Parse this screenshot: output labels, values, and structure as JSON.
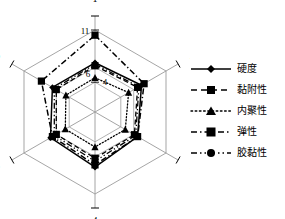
{
  "chart_data": {
    "type": "radar",
    "title": "",
    "xlabel": "",
    "ylabel": "",
    "grid": true,
    "legend_position": "right",
    "axes": [
      "1",
      "2",
      "3",
      "4",
      "5",
      "6"
    ],
    "categories": [
      "1",
      "2",
      "3",
      "4",
      "5",
      "6"
    ],
    "tick_labels": [
      "4",
      "6",
      "11"
    ],
    "rlim": [
      0,
      11
    ],
    "rings": [
      4,
      6,
      11
    ],
    "series": [
      {
        "name": "硬度",
        "marker": "diamond",
        "line": "solid",
        "values": [
          6.6,
          7.2,
          6.6,
          7.4,
          6.9,
          6.6
        ]
      },
      {
        "name": "黏附性",
        "marker": "square",
        "line": "dashed",
        "values": [
          6.2,
          6.6,
          6.1,
          6.2,
          6.0,
          6.0
        ]
      },
      {
        "name": "内聚性",
        "marker": "triangle",
        "line": "dotted",
        "values": [
          4.6,
          5.2,
          4.7,
          4.7,
          4.6,
          4.5
        ]
      },
      {
        "name": "弹性",
        "marker": "square",
        "line": "dashdot",
        "values": [
          10.3,
          7.6,
          6.6,
          7.1,
          6.6,
          8.3
        ]
      },
      {
        "name": "胶黏性",
        "marker": "circle",
        "line": "dashdotdot",
        "values": [
          6.4,
          6.8,
          6.3,
          6.6,
          6.3,
          6.3
        ]
      }
    ]
  },
  "legend": {
    "items": [
      {
        "label": "硬度"
      },
      {
        "label": "黏附性"
      },
      {
        "label": "内聚性"
      },
      {
        "label": "弹性"
      },
      {
        "label": "胶黏性"
      }
    ]
  },
  "colors": {
    "line": "#000000",
    "grid": "#8a8a8a",
    "spoke": "#9a9a9a",
    "background": "#ffffff"
  }
}
